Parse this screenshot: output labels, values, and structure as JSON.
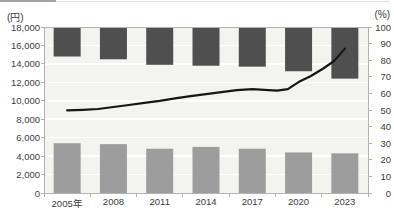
{
  "cropped_top_remnant": "",
  "chart_data": {
    "type": "bar",
    "subtype": "combo-dual-axis (top-anchored bars + bottom bars + line)",
    "title": "",
    "categories": [
      "2005年",
      "2008",
      "2011",
      "2014",
      "2017",
      "2020",
      "2023"
    ],
    "left_axis": {
      "unit": "(円)",
      "min": 0,
      "max": 18000,
      "step": 2000,
      "tick_labels": [
        "0",
        "2,000",
        "4,000",
        "6,000",
        "8,000",
        "10,000",
        "12,000",
        "14,000",
        "16,000",
        "18,000"
      ]
    },
    "right_axis": {
      "unit": "(%)",
      "min": 0,
      "max": 100,
      "step": 10,
      "tick_labels": [
        "0",
        "10",
        "20",
        "30",
        "40",
        "50",
        "60",
        "70",
        "80",
        "90",
        "100"
      ]
    },
    "series": [
      {
        "name": "dark-bars-top-anchored",
        "axis": "left",
        "anchor": "top",
        "note": "bars drawn downward from the 18,000 axis top to these values (yen)",
        "values": [
          14800,
          14500,
          13900,
          13800,
          13700,
          13200,
          12400
        ],
        "color": "#4f4f4f"
      },
      {
        "name": "gray-bars-bottom",
        "axis": "left",
        "anchor": "bottom",
        "note": "bars drawn upward from 0 to these values (yen)",
        "values": [
          5400,
          5300,
          4800,
          5000,
          4800,
          4400,
          4300
        ],
        "color": "#9d9d9d"
      },
      {
        "name": "percent-line",
        "axis": "right",
        "values_at_year_ticks": [
          50,
          52,
          55.5,
          59.5,
          62.5,
          67,
          87
        ],
        "points": [
          [
            2005,
            49.8
          ],
          [
            2006,
            50.1
          ],
          [
            2007,
            50.6
          ],
          [
            2008,
            51.8
          ],
          [
            2009,
            53.0
          ],
          [
            2010,
            54.3
          ],
          [
            2011,
            55.5
          ],
          [
            2012,
            57.0
          ],
          [
            2013,
            58.3
          ],
          [
            2014,
            59.5
          ],
          [
            2015,
            60.8
          ],
          [
            2016,
            61.9
          ],
          [
            2017,
            62.6
          ],
          [
            2017.8,
            62.1
          ],
          [
            2018.6,
            61.6
          ],
          [
            2019.3,
            62.6
          ],
          [
            2020,
            66.8
          ],
          [
            2020.8,
            70.5
          ],
          [
            2021.6,
            75.0
          ],
          [
            2022.3,
            79.5
          ],
          [
            2023,
            87.0
          ]
        ],
        "color": "#161616"
      }
    ],
    "layout": {
      "plot_bg": "#f3f3ef",
      "gridline_color": "#ffffff",
      "border_color": "#b3b3af",
      "grid": "horizontal gridlines every 2,000 yen",
      "legend": "none visible (cropped)"
    }
  }
}
